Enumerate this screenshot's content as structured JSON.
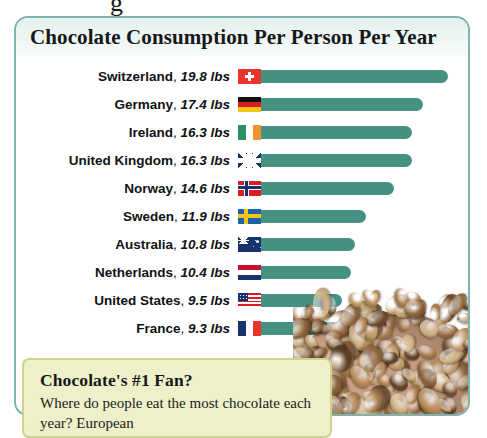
{
  "clipped_text_above_card": "g",
  "card": {
    "title": "Chocolate Consumption Per Person Per Year"
  },
  "chart_data": {
    "type": "bar",
    "title": "Chocolate Consumption Per Person Per Year",
    "xlabel": "",
    "ylabel": "",
    "unit": "lbs",
    "orientation": "horizontal",
    "grid": false,
    "legend": false,
    "xlim": [
      0,
      19.8
    ],
    "categories": [
      "Switzerland",
      "Germany",
      "Ireland",
      "United Kingdom",
      "Norway",
      "Sweden",
      "Australia",
      "Netherlands",
      "United States",
      "France"
    ],
    "values": [
      19.8,
      17.4,
      16.3,
      16.3,
      14.6,
      11.9,
      10.8,
      10.4,
      9.5,
      9.3
    ],
    "value_labels": [
      "19.8 lbs",
      "17.4 lbs",
      "16.3 lbs",
      "16.3 lbs",
      "14.6 lbs",
      "11.9 lbs",
      "10.8 lbs",
      "10.4 lbs",
      "9.5 lbs",
      "9.3 lbs"
    ],
    "bar_color": "#459182",
    "rows": [
      {
        "country": "Switzerland",
        "value": "19.8 lbs",
        "flag": "flag-switzerland",
        "flag_class": "f-ch",
        "bar_px": 188
      },
      {
        "country": "Germany",
        "value": "17.4 lbs",
        "flag": "flag-germany",
        "flag_class": "f-de",
        "bar_px": 163
      },
      {
        "country": "Ireland",
        "value": "16.3 lbs",
        "flag": "flag-ireland",
        "flag_class": "f-ie",
        "bar_px": 152
      },
      {
        "country": "United Kingdom",
        "value": "16.3 lbs",
        "flag": "flag-united-kingdom",
        "flag_class": "f-gb",
        "bar_px": 152
      },
      {
        "country": "Norway",
        "value": "14.6 lbs",
        "flag": "flag-norway",
        "flag_class": "f-no",
        "bar_px": 134
      },
      {
        "country": "Sweden",
        "value": "11.9 lbs",
        "flag": "flag-sweden",
        "flag_class": "f-se",
        "bar_px": 106
      },
      {
        "country": "Australia",
        "value": "10.8 lbs",
        "flag": "flag-australia",
        "flag_class": "f-au",
        "bar_px": 95
      },
      {
        "country": "Netherlands",
        "value": "10.4 lbs",
        "flag": "flag-netherlands",
        "flag_class": "f-nl",
        "bar_px": 91
      },
      {
        "country": "United States",
        "value": "9.5 lbs",
        "flag": "flag-united-states",
        "flag_class": "f-us",
        "bar_px": 82
      },
      {
        "country": "France",
        "value": "9.3 lbs",
        "flag": "flag-france",
        "flag_class": "f-fr",
        "bar_px": 80
      }
    ]
  },
  "callout": {
    "heading": "Chocolate's #1 Fan?",
    "body": "Where do people eat the most chocolate each year? European"
  },
  "colors": {
    "bar": "#459182",
    "card_border": "#7fb3ac",
    "header_band": "#e4f0ec",
    "callout_bg": "#eef0c9",
    "callout_border": "#cdd48c"
  }
}
